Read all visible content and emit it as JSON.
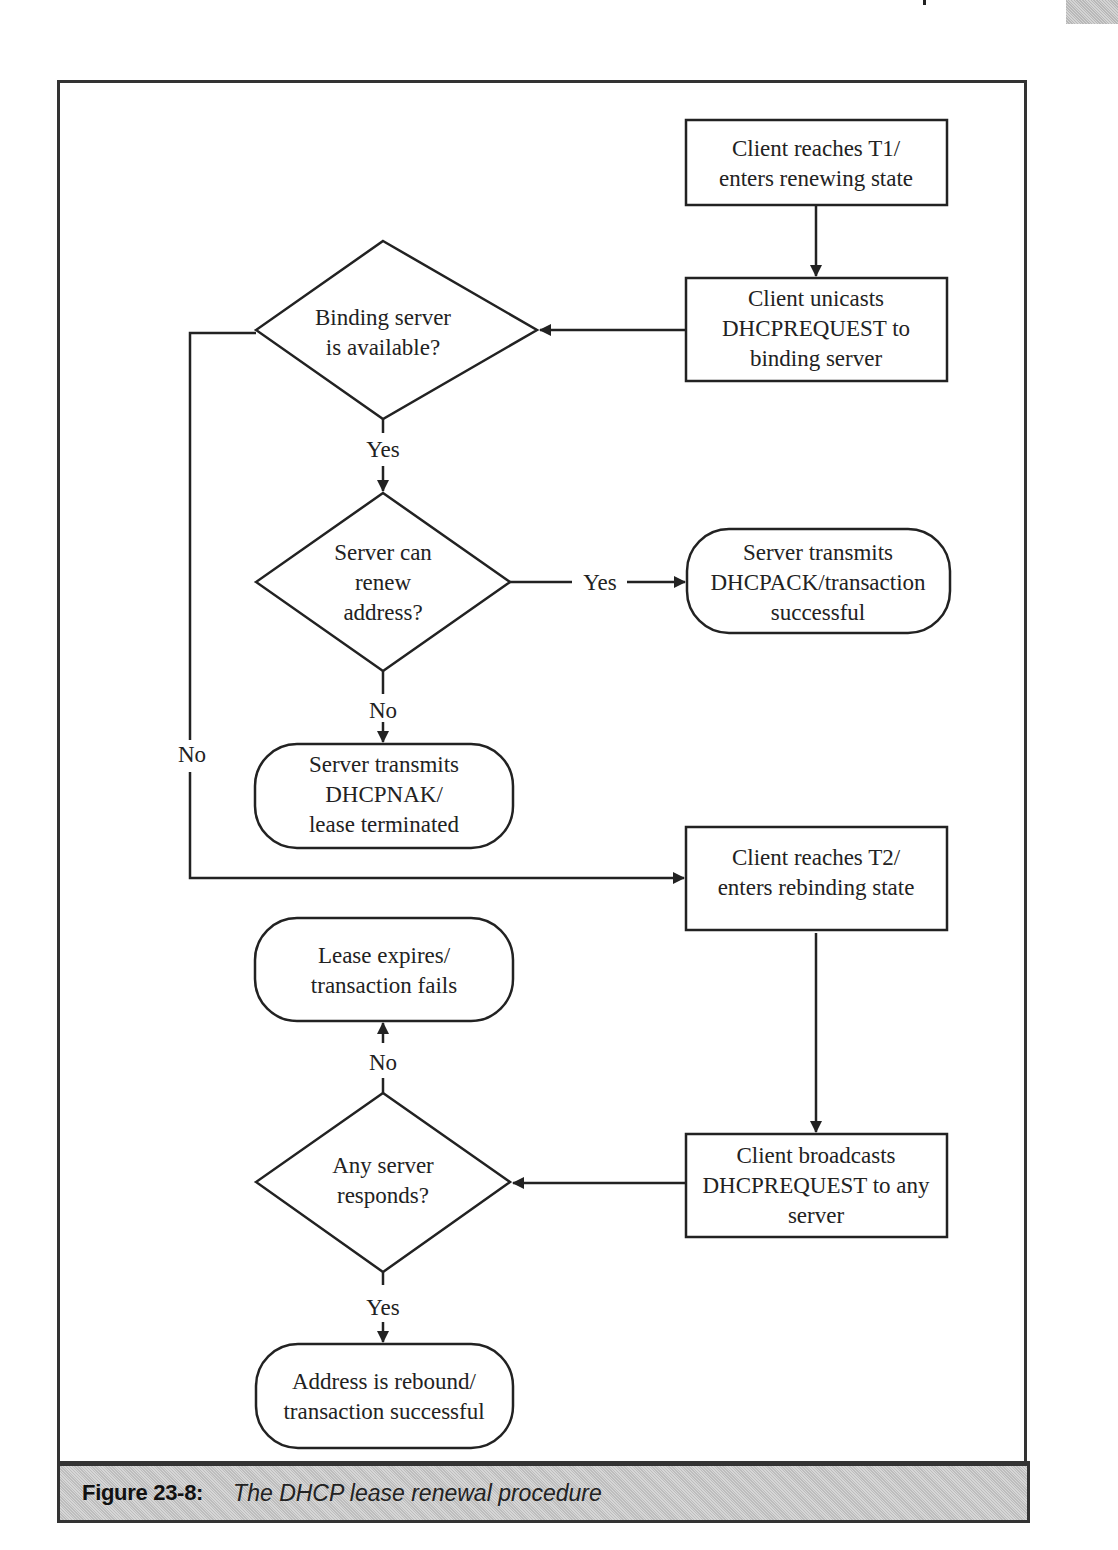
{
  "page": {
    "caption_label": "Figure 23-8:",
    "caption_text": "The DHCP lease renewal procedure"
  },
  "nodes": {
    "t1": {
      "lines": [
        "Client reaches T1/",
        "enters renewing state"
      ],
      "shape": "rectangle"
    },
    "unicast": {
      "lines": [
        "Client unicasts",
        "DHCPREQUEST to",
        "binding server"
      ],
      "shape": "rectangle"
    },
    "binding_available": {
      "lines": [
        "Binding server",
        "is available?"
      ],
      "shape": "diamond"
    },
    "can_renew": {
      "lines": [
        "Server can",
        "renew",
        "address?"
      ],
      "shape": "diamond"
    },
    "ack": {
      "lines": [
        "Server transmits",
        "DHCPACK/transaction",
        "successful"
      ],
      "shape": "rounded"
    },
    "nak": {
      "lines": [
        "Server transmits",
        "DHCPNAK/",
        "lease terminated"
      ],
      "shape": "rounded"
    },
    "t2": {
      "lines": [
        "Client reaches T2/",
        "enters rebinding state"
      ],
      "shape": "rectangle"
    },
    "expires": {
      "lines": [
        "Lease expires/",
        "transaction fails"
      ],
      "shape": "rounded"
    },
    "any_responds": {
      "lines": [
        "Any server",
        "responds?"
      ],
      "shape": "diamond"
    },
    "broadcast": {
      "lines": [
        "Client broadcasts",
        "DHCPREQUEST to any",
        "server"
      ],
      "shape": "rectangle"
    },
    "rebound": {
      "lines": [
        "Address is rebound/",
        "transaction successful"
      ],
      "shape": "rounded"
    }
  },
  "edge_labels": {
    "binding_yes": "Yes",
    "binding_no": "No",
    "renew_yes": "Yes",
    "renew_no": "No",
    "any_no": "No",
    "any_yes": "Yes"
  },
  "colors": {
    "stroke": "#222222",
    "caption_bg": "#cccccc",
    "frame": "#333333"
  }
}
